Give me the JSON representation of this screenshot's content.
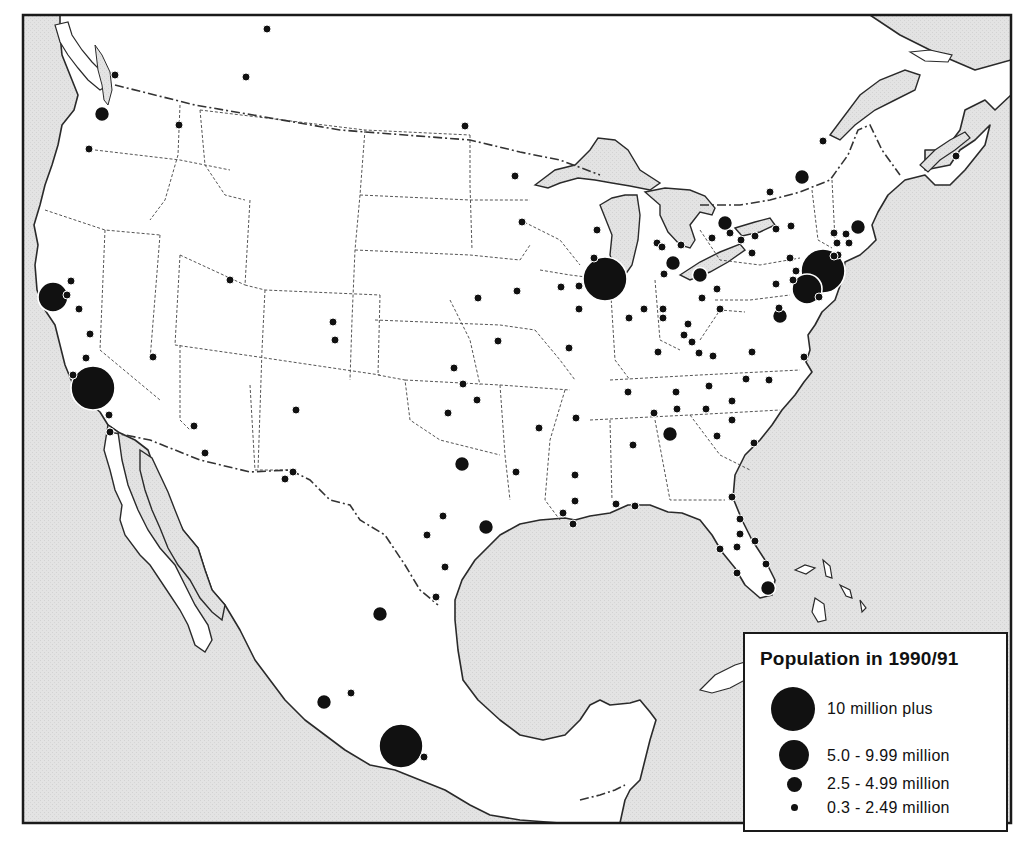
{
  "map": {
    "subject": "Major cities of North America (USA, Canada, Mexico) by population",
    "colors": {
      "land": "#ffffff",
      "water": "#e2e2e2",
      "coastline": "#2a2a2a",
      "state_border": "#555555",
      "city_dot": "#111111",
      "frame": "#1a1a1a"
    }
  },
  "legend": {
    "title": "Population in 1990/91",
    "classes": [
      {
        "label": "10 million plus",
        "size": "xl",
        "diameter": 44
      },
      {
        "label": "5.0 - 9.99 million",
        "size": "l",
        "diameter": 30
      },
      {
        "label": "2.5 - 4.99 million",
        "size": "m",
        "diameter": 16
      },
      {
        "label": "0.3 - 2.49 million",
        "size": "s",
        "diameter": 8
      }
    ]
  },
  "cities": [
    {
      "x": 267,
      "y": 29,
      "size": "s"
    },
    {
      "x": 246,
      "y": 77,
      "size": "s"
    },
    {
      "x": 115,
      "y": 75,
      "size": "s"
    },
    {
      "x": 102,
      "y": 114,
      "size": "m"
    },
    {
      "x": 179,
      "y": 125,
      "size": "s"
    },
    {
      "x": 89,
      "y": 149,
      "size": "s"
    },
    {
      "x": 465,
      "y": 126,
      "size": "s"
    },
    {
      "x": 515,
      "y": 176,
      "size": "s"
    },
    {
      "x": 522,
      "y": 222,
      "size": "s"
    },
    {
      "x": 823,
      "y": 141,
      "size": "s"
    },
    {
      "x": 802,
      "y": 177,
      "size": "m"
    },
    {
      "x": 956,
      "y": 156,
      "size": "s"
    },
    {
      "x": 725,
      "y": 223,
      "size": "m"
    },
    {
      "x": 770,
      "y": 192,
      "size": "s"
    },
    {
      "x": 858,
      "y": 227,
      "size": "m"
    },
    {
      "x": 605,
      "y": 279,
      "size": "xl"
    },
    {
      "x": 673,
      "y": 263,
      "size": "m"
    },
    {
      "x": 700,
      "y": 275,
      "size": "m"
    },
    {
      "x": 702,
      "y": 298,
      "size": "s"
    },
    {
      "x": 717,
      "y": 289,
      "size": "s"
    },
    {
      "x": 664,
      "y": 274,
      "size": "s"
    },
    {
      "x": 594,
      "y": 258,
      "size": "s"
    },
    {
      "x": 579,
      "y": 286,
      "size": "s"
    },
    {
      "x": 597,
      "y": 230,
      "size": "s"
    },
    {
      "x": 657,
      "y": 243,
      "size": "s"
    },
    {
      "x": 662,
      "y": 247,
      "size": "s"
    },
    {
      "x": 681,
      "y": 245,
      "size": "s"
    },
    {
      "x": 712,
      "y": 238,
      "size": "s"
    },
    {
      "x": 730,
      "y": 233,
      "size": "s"
    },
    {
      "x": 741,
      "y": 240,
      "size": "s"
    },
    {
      "x": 755,
      "y": 236,
      "size": "s"
    },
    {
      "x": 776,
      "y": 229,
      "size": "s"
    },
    {
      "x": 791,
      "y": 226,
      "size": "s"
    },
    {
      "x": 834,
      "y": 233,
      "size": "s"
    },
    {
      "x": 846,
      "y": 234,
      "size": "s"
    },
    {
      "x": 837,
      "y": 243,
      "size": "s"
    },
    {
      "x": 849,
      "y": 243,
      "size": "s"
    },
    {
      "x": 838,
      "y": 255,
      "size": "s"
    },
    {
      "x": 823,
      "y": 271,
      "size": "xl"
    },
    {
      "x": 807,
      "y": 289,
      "size": "l"
    },
    {
      "x": 834,
      "y": 256,
      "size": "s"
    },
    {
      "x": 790,
      "y": 258,
      "size": "s"
    },
    {
      "x": 796,
      "y": 271,
      "size": "s"
    },
    {
      "x": 793,
      "y": 280,
      "size": "s"
    },
    {
      "x": 776,
      "y": 284,
      "size": "s"
    },
    {
      "x": 779,
      "y": 308,
      "size": "s"
    },
    {
      "x": 780,
      "y": 316,
      "size": "m"
    },
    {
      "x": 752,
      "y": 253,
      "size": "s"
    },
    {
      "x": 819,
      "y": 297,
      "size": "s"
    },
    {
      "x": 53,
      "y": 297,
      "size": "l"
    },
    {
      "x": 71,
      "y": 281,
      "size": "s"
    },
    {
      "x": 67,
      "y": 295,
      "size": "s"
    },
    {
      "x": 79,
      "y": 309,
      "size": "s"
    },
    {
      "x": 90,
      "y": 334,
      "size": "s"
    },
    {
      "x": 86,
      "y": 358,
      "size": "s"
    },
    {
      "x": 73,
      "y": 375,
      "size": "s"
    },
    {
      "x": 93,
      "y": 388,
      "size": "xl"
    },
    {
      "x": 109,
      "y": 415,
      "size": "s"
    },
    {
      "x": 110,
      "y": 432,
      "size": "s"
    },
    {
      "x": 153,
      "y": 357,
      "size": "s"
    },
    {
      "x": 230,
      "y": 280,
      "size": "s"
    },
    {
      "x": 333,
      "y": 322,
      "size": "s"
    },
    {
      "x": 335,
      "y": 340,
      "size": "s"
    },
    {
      "x": 194,
      "y": 426,
      "size": "s"
    },
    {
      "x": 205,
      "y": 453,
      "size": "s"
    },
    {
      "x": 296,
      "y": 410,
      "size": "s"
    },
    {
      "x": 293,
      "y": 472,
      "size": "s"
    },
    {
      "x": 285,
      "y": 479,
      "size": "s"
    },
    {
      "x": 454,
      "y": 368,
      "size": "s"
    },
    {
      "x": 478,
      "y": 298,
      "size": "s"
    },
    {
      "x": 517,
      "y": 291,
      "size": "s"
    },
    {
      "x": 498,
      "y": 341,
      "size": "s"
    },
    {
      "x": 561,
      "y": 287,
      "size": "s"
    },
    {
      "x": 569,
      "y": 348,
      "size": "s"
    },
    {
      "x": 579,
      "y": 309,
      "size": "s"
    },
    {
      "x": 629,
      "y": 318,
      "size": "s"
    },
    {
      "x": 644,
      "y": 309,
      "size": "s"
    },
    {
      "x": 663,
      "y": 309,
      "size": "s"
    },
    {
      "x": 663,
      "y": 318,
      "size": "s"
    },
    {
      "x": 688,
      "y": 324,
      "size": "s"
    },
    {
      "x": 658,
      "y": 352,
      "size": "s"
    },
    {
      "x": 684,
      "y": 335,
      "size": "s"
    },
    {
      "x": 692,
      "y": 342,
      "size": "s"
    },
    {
      "x": 720,
      "y": 309,
      "size": "s"
    },
    {
      "x": 713,
      "y": 356,
      "size": "s"
    },
    {
      "x": 448,
      "y": 413,
      "size": "s"
    },
    {
      "x": 477,
      "y": 400,
      "size": "s"
    },
    {
      "x": 463,
      "y": 384,
      "size": "s"
    },
    {
      "x": 539,
      "y": 428,
      "size": "s"
    },
    {
      "x": 576,
      "y": 418,
      "size": "s"
    },
    {
      "x": 628,
      "y": 392,
      "size": "s"
    },
    {
      "x": 676,
      "y": 392,
      "size": "s"
    },
    {
      "x": 709,
      "y": 386,
      "size": "s"
    },
    {
      "x": 699,
      "y": 353,
      "size": "s"
    },
    {
      "x": 752,
      "y": 352,
      "size": "s"
    },
    {
      "x": 746,
      "y": 379,
      "size": "s"
    },
    {
      "x": 769,
      "y": 380,
      "size": "s"
    },
    {
      "x": 804,
      "y": 357,
      "size": "s"
    },
    {
      "x": 654,
      "y": 413,
      "size": "s"
    },
    {
      "x": 677,
      "y": 409,
      "size": "s"
    },
    {
      "x": 706,
      "y": 409,
      "size": "s"
    },
    {
      "x": 732,
      "y": 401,
      "size": "s"
    },
    {
      "x": 732,
      "y": 420,
      "size": "s"
    },
    {
      "x": 717,
      "y": 436,
      "size": "s"
    },
    {
      "x": 754,
      "y": 443,
      "size": "s"
    },
    {
      "x": 670,
      "y": 434,
      "size": "m"
    },
    {
      "x": 633,
      "y": 445,
      "size": "s"
    },
    {
      "x": 462,
      "y": 464,
      "size": "m"
    },
    {
      "x": 516,
      "y": 472,
      "size": "s"
    },
    {
      "x": 575,
      "y": 475,
      "size": "s"
    },
    {
      "x": 575,
      "y": 501,
      "size": "s"
    },
    {
      "x": 443,
      "y": 516,
      "size": "s"
    },
    {
      "x": 427,
      "y": 535,
      "size": "s"
    },
    {
      "x": 486,
      "y": 527,
      "size": "m"
    },
    {
      "x": 563,
      "y": 513,
      "size": "s"
    },
    {
      "x": 573,
      "y": 524,
      "size": "s"
    },
    {
      "x": 616,
      "y": 504,
      "size": "s"
    },
    {
      "x": 635,
      "y": 506,
      "size": "s"
    },
    {
      "x": 732,
      "y": 497,
      "size": "s"
    },
    {
      "x": 740,
      "y": 519,
      "size": "s"
    },
    {
      "x": 740,
      "y": 534,
      "size": "s"
    },
    {
      "x": 737,
      "y": 547,
      "size": "s"
    },
    {
      "x": 755,
      "y": 541,
      "size": "s"
    },
    {
      "x": 720,
      "y": 549,
      "size": "s"
    },
    {
      "x": 766,
      "y": 564,
      "size": "s"
    },
    {
      "x": 737,
      "y": 573,
      "size": "s"
    },
    {
      "x": 768,
      "y": 588,
      "size": "m"
    },
    {
      "x": 445,
      "y": 567,
      "size": "s"
    },
    {
      "x": 436,
      "y": 597,
      "size": "s"
    },
    {
      "x": 380,
      "y": 614,
      "size": "m"
    },
    {
      "x": 324,
      "y": 702,
      "size": "m"
    },
    {
      "x": 351,
      "y": 693,
      "size": "s"
    },
    {
      "x": 401,
      "y": 746,
      "size": "xl"
    },
    {
      "x": 424,
      "y": 757,
      "size": "s"
    }
  ]
}
